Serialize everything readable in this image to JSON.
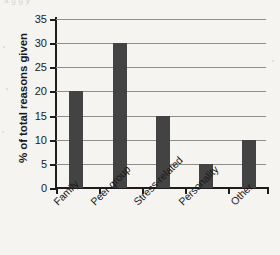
{
  "artifact_text": "a                    g                              g                 y",
  "chart_data": {
    "type": "bar",
    "title": "",
    "xlabel": "",
    "ylabel": "% of total reasons given",
    "categories": [
      "Family",
      "Peer group",
      "Stress-related",
      "Personality",
      "Other"
    ],
    "values": [
      20,
      30,
      15,
      5,
      10
    ],
    "ylim": [
      0,
      35
    ],
    "ytick_labels": [
      "0",
      "5",
      "10",
      "15",
      "20",
      "25",
      "30",
      "35"
    ],
    "ytick_values": [
      0,
      5,
      10,
      15,
      20,
      25,
      30,
      35
    ],
    "grid": true,
    "legend": "none",
    "bar_color": "#434343",
    "gridline_color": "#8f8d8a",
    "axis_color": "#1d1d1d",
    "background_color": "#f5f4f1",
    "xtick_label_rotation": "-45"
  }
}
